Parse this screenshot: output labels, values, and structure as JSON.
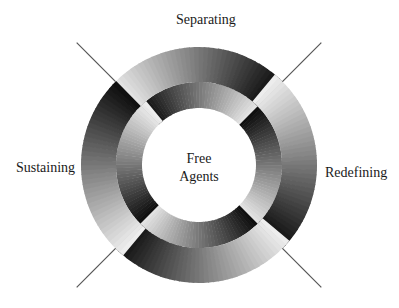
{
  "diagram": {
    "center_label_line1": "Free",
    "center_label_line2": "Agents",
    "stages": [
      {
        "label": "Separating",
        "position": "top"
      },
      {
        "label": "Redefining",
        "position": "right"
      },
      {
        "label": "Sustaining",
        "position": "left"
      }
    ],
    "colors": {
      "dark": "#0a0a0a",
      "light": "#f2f2f2",
      "line": "#555555",
      "background": "#ffffff"
    },
    "geometry": {
      "cx": 199,
      "cy": 165,
      "outer_r": 118,
      "mid_r": 83,
      "inner_r": 57
    }
  }
}
